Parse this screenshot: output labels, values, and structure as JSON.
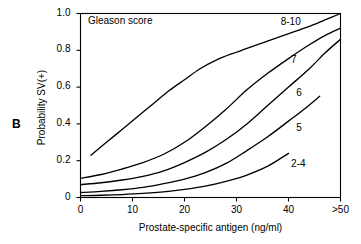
{
  "figure": {
    "panel_label": "B",
    "background_color": "#ffffff",
    "line_color": "#000000",
    "axis_color": "#000000"
  },
  "chart_data": {
    "type": "line",
    "title": "",
    "subtitle": "",
    "legend_title": "Gleason score",
    "legend_position": "inline-curve-labels",
    "grid": false,
    "xlabel": "Prostate-specific antigen (ng/ml)",
    "ylabel": "Probability SV(+)",
    "xlim": [
      0,
      50
    ],
    "ylim": [
      0,
      1.0
    ],
    "xticks": [
      0,
      10,
      20,
      30,
      40,
      50
    ],
    "xtick_labels": [
      "0",
      "10",
      "20",
      "30",
      "40",
      ">50"
    ],
    "yticks": [
      0,
      0.2,
      0.4,
      0.6,
      0.8,
      1.0
    ],
    "ytick_labels": [
      "0",
      "0.2",
      "0.4",
      "0.6",
      "0.8",
      "1.0"
    ],
    "series": [
      {
        "name": "8-10",
        "label": "8-10",
        "label_x": 38.5,
        "label_y": 0.95,
        "x": [
          2,
          5,
          8,
          11,
          14,
          17,
          20,
          23,
          26,
          29,
          32,
          35,
          38,
          41,
          44,
          47,
          50
        ],
        "y": [
          0.23,
          0.3,
          0.37,
          0.44,
          0.51,
          0.58,
          0.64,
          0.7,
          0.745,
          0.78,
          0.81,
          0.84,
          0.87,
          0.9,
          0.93,
          0.965,
          1.0
        ]
      },
      {
        "name": "7",
        "label": "7",
        "label_x": 40.5,
        "label_y": 0.74,
        "x": [
          0,
          4,
          8,
          12,
          16,
          20,
          24,
          28,
          32,
          36,
          40,
          44,
          47,
          50
        ],
        "y": [
          0.105,
          0.125,
          0.155,
          0.19,
          0.235,
          0.3,
          0.385,
          0.48,
          0.585,
          0.675,
          0.755,
          0.83,
          0.88,
          0.92
        ]
      },
      {
        "name": "6",
        "label": "6",
        "label_x": 41.5,
        "label_y": 0.565,
        "x": [
          0,
          4,
          8,
          12,
          16,
          20,
          24,
          28,
          32,
          36,
          40,
          44,
          47,
          50
        ],
        "y": [
          0.07,
          0.08,
          0.095,
          0.115,
          0.145,
          0.19,
          0.245,
          0.315,
          0.4,
          0.5,
          0.6,
          0.7,
          0.785,
          0.86
        ]
      },
      {
        "name": "5",
        "label": "5",
        "label_x": 41.5,
        "label_y": 0.375,
        "x": [
          0,
          4,
          8,
          12,
          16,
          20,
          24,
          28,
          32,
          36,
          40,
          43,
          46
        ],
        "y": [
          0.027,
          0.033,
          0.042,
          0.055,
          0.075,
          0.1,
          0.135,
          0.185,
          0.255,
          0.33,
          0.415,
          0.48,
          0.55
        ]
      },
      {
        "name": "2-4",
        "label": "2-4",
        "label_x": 40.5,
        "label_y": 0.175,
        "x": [
          0,
          4,
          8,
          12,
          16,
          20,
          24,
          28,
          32,
          36,
          40
        ],
        "y": [
          0.01,
          0.012,
          0.016,
          0.022,
          0.031,
          0.044,
          0.062,
          0.088,
          0.122,
          0.17,
          0.24
        ]
      }
    ]
  }
}
